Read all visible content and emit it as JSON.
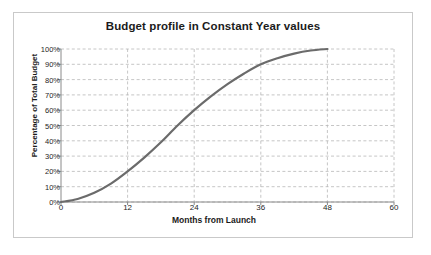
{
  "chart_data": {
    "type": "line",
    "title": "Budget profile in Constant Year values",
    "xlabel": "Months from Launch",
    "ylabel": "Percentage of Total Budget",
    "xlim": [
      0,
      60
    ],
    "ylim": [
      0,
      100
    ],
    "grid": true,
    "legend": false,
    "line_color": "#6b6b6b",
    "xticks": [
      0,
      12,
      24,
      36,
      48,
      60
    ],
    "xtick_labels": [
      "0",
      "12",
      "24",
      "36",
      "48",
      "60"
    ],
    "yticks": [
      0,
      10,
      20,
      30,
      40,
      50,
      60,
      70,
      80,
      90,
      100
    ],
    "ytick_labels": [
      "0%",
      "10%",
      "20%",
      "30%",
      "40%",
      "50%",
      "60%",
      "70%",
      "80%",
      "90%",
      "100%"
    ],
    "series": [
      {
        "name": "Cumulative budget spend",
        "x": [
          0,
          3,
          6,
          9,
          12,
          15,
          18,
          21,
          24,
          27,
          30,
          33,
          36,
          39,
          42,
          45,
          48
        ],
        "values": [
          0,
          2,
          6,
          12,
          20,
          29,
          39,
          50,
          60,
          69,
          77,
          84,
          90,
          94,
          97,
          99,
          100
        ]
      }
    ]
  },
  "frame": {
    "border_color": "#c9c9c9",
    "background": "#ffffff"
  }
}
